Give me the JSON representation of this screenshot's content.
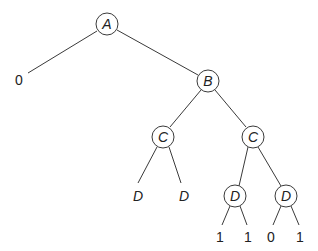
{
  "diagram": {
    "type": "binary-decision-tree",
    "nodes": [
      {
        "id": "A",
        "label": "A",
        "kind": "circled",
        "x": 107,
        "y": 24
      },
      {
        "id": "B",
        "label": "B",
        "kind": "circled",
        "x": 208,
        "y": 81
      },
      {
        "id": "C1",
        "label": "C",
        "kind": "circled",
        "x": 163,
        "y": 137
      },
      {
        "id": "C2",
        "label": "C",
        "kind": "circled",
        "x": 253,
        "y": 137
      },
      {
        "id": "D1",
        "label": "D",
        "kind": "plain-italic",
        "x": 138,
        "y": 196
      },
      {
        "id": "D2",
        "label": "D",
        "kind": "plain-italic",
        "x": 184,
        "y": 196
      },
      {
        "id": "D3",
        "label": "D",
        "kind": "circled",
        "x": 235,
        "y": 196
      },
      {
        "id": "D4",
        "label": "D",
        "kind": "circled",
        "x": 286,
        "y": 196
      },
      {
        "id": "L0",
        "label": "0",
        "kind": "leaf",
        "x": 19,
        "y": 80
      },
      {
        "id": "L1",
        "label": "1",
        "kind": "leaf",
        "x": 220,
        "y": 237
      },
      {
        "id": "L2",
        "label": "1",
        "kind": "leaf",
        "x": 248,
        "y": 237
      },
      {
        "id": "L3",
        "label": "0",
        "kind": "leaf",
        "x": 271,
        "y": 237
      },
      {
        "id": "L4",
        "label": "1",
        "kind": "leaf",
        "x": 300,
        "y": 237
      }
    ],
    "edges": [
      {
        "from": "A",
        "to": "L0",
        "x1": 97,
        "y1": 31,
        "x2": 28,
        "y2": 73
      },
      {
        "from": "A",
        "to": "B",
        "x1": 117,
        "y1": 30,
        "x2": 198,
        "y2": 75
      },
      {
        "from": "B",
        "to": "C1",
        "x1": 201,
        "y1": 90,
        "x2": 170,
        "y2": 127
      },
      {
        "from": "B",
        "to": "C2",
        "x1": 215,
        "y1": 90,
        "x2": 246,
        "y2": 127
      },
      {
        "from": "C1",
        "to": "D1",
        "x1": 157,
        "y1": 147,
        "x2": 138,
        "y2": 183
      },
      {
        "from": "C1",
        "to": "D2",
        "x1": 169,
        "y1": 147,
        "x2": 181,
        "y2": 183
      },
      {
        "from": "C2",
        "to": "D3",
        "x1": 248,
        "y1": 147,
        "x2": 239,
        "y2": 186
      },
      {
        "from": "C2",
        "to": "D4",
        "x1": 258,
        "y1": 147,
        "x2": 281,
        "y2": 186
      },
      {
        "from": "D3",
        "to": "L1",
        "x1": 230,
        "y1": 206,
        "x2": 222,
        "y2": 225
      },
      {
        "from": "D3",
        "to": "L2",
        "x1": 240,
        "y1": 206,
        "x2": 247,
        "y2": 225
      },
      {
        "from": "D4",
        "to": "L3",
        "x1": 281,
        "y1": 206,
        "x2": 273,
        "y2": 225
      },
      {
        "from": "D4",
        "to": "L4",
        "x1": 291,
        "y1": 206,
        "x2": 299,
        "y2": 225
      }
    ],
    "node_radius": 11,
    "colors": {
      "stroke": "#3a3a3a",
      "text": "#222222",
      "background": "#ffffff"
    }
  }
}
